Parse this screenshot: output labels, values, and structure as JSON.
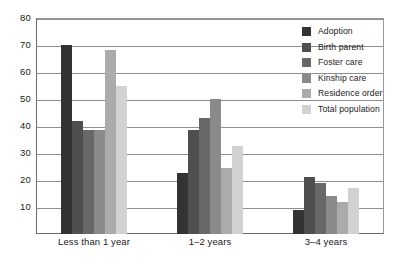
{
  "chart_data": {
    "type": "bar",
    "title": "",
    "subtitle": "",
    "xlabel": "",
    "ylabel": "",
    "categories": [
      "Less than 1 year",
      "1–2 years",
      "3–4 years"
    ],
    "ylim": [
      0,
      80
    ],
    "yticks": [
      80,
      70,
      60,
      50,
      40,
      30,
      20,
      10
    ],
    "ytick_labels": [
      "80",
      "70",
      "60",
      "50",
      "40",
      "30",
      "20",
      "10"
    ],
    "grid": true,
    "legend_position": "right",
    "series": [
      {
        "name": "Adoption",
        "color": "#333333",
        "values": [
          70,
          22.5,
          9
        ]
      },
      {
        "name": "Birth parent",
        "color": "#4f4f4f",
        "values": [
          42,
          38.5,
          21
        ]
      },
      {
        "name": "Foster care",
        "color": "#686868",
        "values": [
          38.5,
          43,
          19
        ]
      },
      {
        "name": "Kinship care",
        "color": "#8a8a8a",
        "values": [
          38.5,
          50,
          14
        ]
      },
      {
        "name": "Residence order",
        "color": "#ababab",
        "values": [
          68,
          24.5,
          12
        ]
      },
      {
        "name": "Total population",
        "color": "#d2d2d2",
        "values": [
          55,
          32.5,
          17
        ]
      }
    ]
  }
}
